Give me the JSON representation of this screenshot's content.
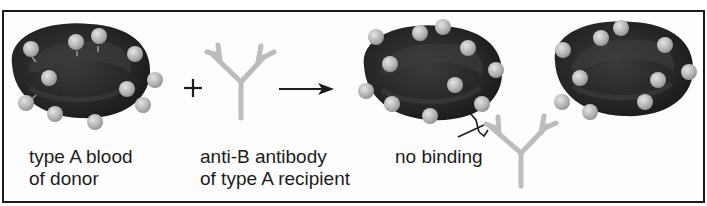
{
  "diagram": {
    "type": "blood-type-compatibility",
    "symbols": {
      "plus": "+",
      "arrow": "→"
    },
    "items": [
      {
        "id": "donor-cell",
        "label_lines": [
          "type A blood",
          "of donor"
        ],
        "icon": "red-blood-cell-with-A-antigens"
      },
      {
        "id": "antibody",
        "label_lines": [
          "anti-B antibody",
          "of type A recipient"
        ],
        "icon": "Y-shaped-antibody"
      },
      {
        "id": "result",
        "label_lines": [
          "no binding"
        ],
        "icon": "cells-unbound-with-antibody"
      }
    ],
    "colors": {
      "cell": "#2a2a2a",
      "antigen": "#b8b8b8",
      "antibody": "#bdbdbd",
      "frame": "#1a1a1a",
      "text": "#1c1c1c"
    }
  }
}
